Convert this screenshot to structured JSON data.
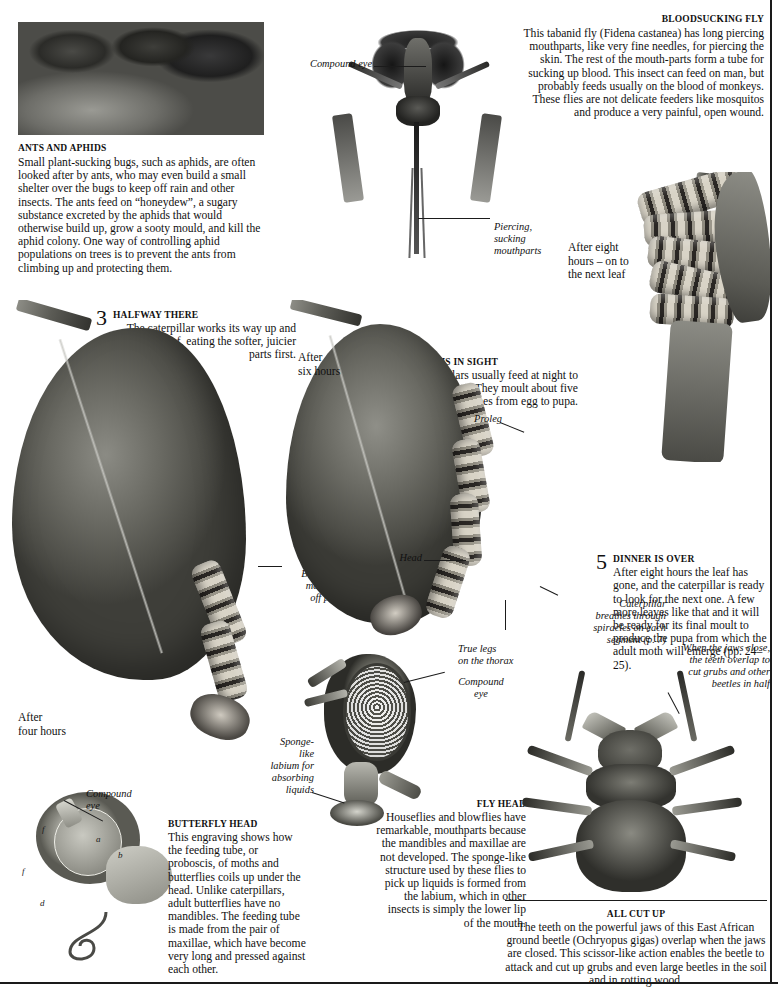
{
  "ants_and_aphids": {
    "heading": "ANTS AND APHIDS",
    "body": "Small plant-sucking bugs, such as aphids, are often looked after by ants, who may even build a small shelter over the bugs to keep off rain and other insects. The ants feed on “honeydew”, a sugary substance excreted by the aphids that would otherwise build up, grow a sooty mould, and kill the aphid colony. One way of controlling aphid populations on trees is to prevent the ants from climbing up and protecting them."
  },
  "bloodsucking_fly": {
    "heading": "BLOODSUCKING FLY",
    "body": "This tabanid fly (Fidena castanea) has long piercing mouthparts, like very fine needles, for piercing the skin. The rest of the mouth-parts form a tube for sucking up blood. This insect can feed on man, but probably feeds usually on the blood of monkeys. These flies are not delicate feeders like mosquitos and produce a very painful, open wound.",
    "species_italic": "Fidena castanea",
    "labels": {
      "compound_eye": "Compound eye",
      "piercing_mouthparts": "Piercing,\nsucking\nmouthparts"
    }
  },
  "steps": [
    {
      "number": "3",
      "heading": "HALFWAY THERE",
      "body": "The caterpillar works its way up and down the leaf, eating the softer, juicier parts first."
    },
    {
      "number": "4",
      "heading": "THE END IS IN SIGHT",
      "body": "Caterpillars usually feed at night to avoid predators. They moult about five times from egg to pupa."
    },
    {
      "number": "5",
      "heading": "DINNER IS OVER",
      "body": "After eight hours the leaf has gone, and the caterpillar is ready to look for the next one. A few more leaves like that and it will be ready for its final moult to produce the pupa from which the adult moth will emerge (pp. 24–25)."
    }
  ],
  "time_labels": {
    "after_four_hours": "After\nfour hours",
    "after_six_hours": "After\nsix hours",
    "after_eight_hours": "After eight\nhours – on to\nthe next leaf"
  },
  "caterpillar_labels": {
    "black_and_yellow": "Black and yellow\nmarkings ward\noff predators",
    "proleg": "Proleg",
    "head": "Head",
    "true_legs": "True legs\non the thorax",
    "spiracles": "Caterpillar\nbreathes through\nspiracles on each\nsegment (p. 7)"
  },
  "butterfly_head": {
    "heading": "BUTTERFLY HEAD",
    "body": "This engraving shows how the feeding tube, or proboscis, of moths and butterflies coils up under the head. Unlike caterpillars, adult butterflies have no mandibles. The feeding tube is made from the pair of maxillae, which have become very long and pressed against each other.",
    "label_compound_eye": "Compound\neye",
    "letters": [
      "a",
      "b",
      "d",
      "e",
      "f"
    ]
  },
  "fly_head": {
    "heading": "FLY HEAD",
    "body": "Houseflies and blowflies have remarkable, mouthparts because the mandibles and maxillae are not developed. The sponge-like structure used by these flies to pick up liquids is formed from the labium, which in other insects is simply the lower lip of the mouth.",
    "label_compound_eye": "Compound\neye",
    "label_sponge": "Sponge-\nlike\nlabium for\nabsorbing\nliquids"
  },
  "all_cut_up": {
    "heading": "ALL CUT UP",
    "body": "The teeth on the powerful jaws of this East African ground beetle (Ochryopus gigas) overlap when the jaws are closed. This scissor-like action enables the beetle to attack and cut up grubs and even large beetles in the soil and in rotting wood.",
    "species_italic": "Ochryopus gigas",
    "label_jaws": "When the jaws close,\nthe teeth overlap to\ncut grubs and other\nbeetles in half"
  },
  "colors": {
    "ink": "#111111",
    "rule": "#1a1a1a",
    "paper": "#ffffff"
  }
}
